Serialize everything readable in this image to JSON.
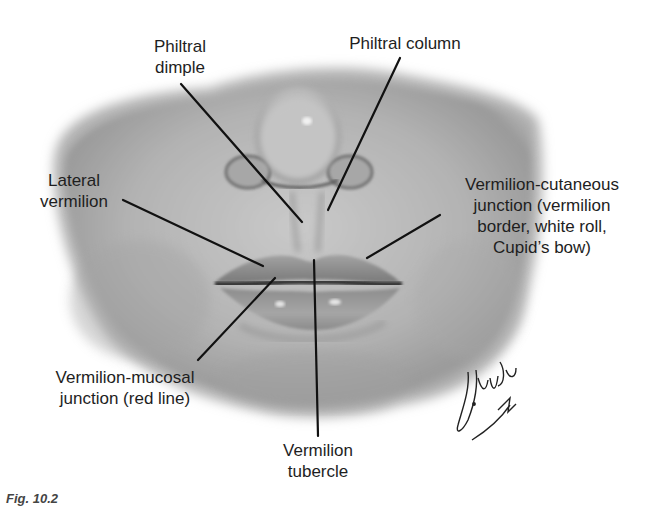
{
  "figure": {
    "type": "anatomical illustration",
    "labels": {
      "philtral_dimple": {
        "line1": "Philtral",
        "line2": "dimple"
      },
      "philtral_column": {
        "line1": "Philtral column"
      },
      "lateral_vermilion": {
        "line1": "Lateral",
        "line2": "vermilion"
      },
      "vermilion_cutaneous": {
        "line1": "Vermilion-cutaneous",
        "line2": "junction (vermilion",
        "line3": "border, white roll,",
        "line4": "Cupid’s bow)"
      },
      "vermilion_mucosal": {
        "line1": "Vermilion-mucosal",
        "line2": "junction (red line)"
      },
      "vermilion_tubercle": {
        "line1": "Vermilion",
        "line2": "tubercle"
      }
    },
    "signature": "artist-signature",
    "caption_partial": "Fig. 10.2"
  }
}
